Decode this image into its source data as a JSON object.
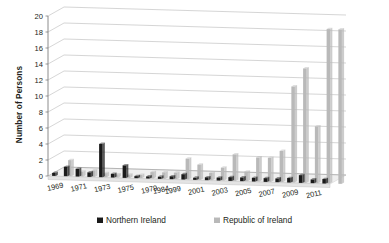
{
  "chart_data": {
    "type": "bar",
    "title": "",
    "subtitle": "",
    "xlabel": "",
    "ylabel": "Number of Persons",
    "ylim": [
      0,
      20
    ],
    "ytick_step": 2,
    "yticks": [
      "0",
      "2",
      "4",
      "6",
      "8",
      "10",
      "12",
      "14",
      "16",
      "18",
      "20"
    ],
    "grid": true,
    "three_d": true,
    "legend_position": "bottom",
    "categories": [
      "1969",
      "1970",
      "1971",
      "1972",
      "1973",
      "1974",
      "1975",
      "1976",
      "1979",
      "1984",
      "1999",
      "2000",
      "2001",
      "2002",
      "2003",
      "2004",
      "2005",
      "2006",
      "2007",
      "2008",
      "2009",
      "2010",
      "2011",
      "2012"
    ],
    "tick_labels_shown": [
      "1969",
      "1971",
      "1973",
      "1975",
      "1979",
      "1984",
      "1999",
      "2001",
      "2003",
      "2005",
      "2007",
      "2009",
      "2011"
    ],
    "series": [
      {
        "name": "Northern Ireland",
        "color": "#1a1a1a",
        "values": [
          0.4,
          1.2,
          1.0,
          0.6,
          4.2,
          0.5,
          1.6,
          0.3,
          0.3,
          0.3,
          0.4,
          0.7,
          0.3,
          0.4,
          0.4,
          0.5,
          0.5,
          0.5,
          0.5,
          0.5,
          0.6,
          1.0,
          0.5,
          0.6
        ]
      },
      {
        "name": "Republic of Ireland",
        "color": "#b9b9b9",
        "values": [
          2.0,
          0.6,
          0.8,
          0.5,
          0.4,
          0.4,
          0.4,
          0.8,
          0.8,
          0.8,
          2.6,
          1.9,
          0.9,
          1.6,
          3.3,
          1.2,
          3.0,
          3.0,
          3.9,
          12.0,
          14.3,
          7.1,
          19.3,
          19.3
        ]
      }
    ],
    "legend": [
      {
        "label": "Northern Ireland",
        "color": "#1a1a1a",
        "swatch": "dark"
      },
      {
        "label": "Republic of Ireland",
        "color": "#b9b9b9",
        "swatch": "light"
      }
    ]
  },
  "axis": {
    "y_title": "Number of Persons"
  },
  "colors": {
    "background": "#ffffff",
    "gridline": "#9a9a9a",
    "axis": "#6e6e6e",
    "floor": "#efefef",
    "text": "#231f20",
    "series_dark": "#1a1a1a",
    "series_light": "#b9b9b9"
  }
}
